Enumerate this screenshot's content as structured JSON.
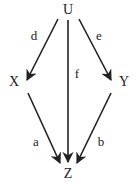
{
  "diagram": {
    "type": "directed-graph",
    "nodes": [
      {
        "id": "U",
        "label": "U",
        "x": 68,
        "y": 10
      },
      {
        "id": "X",
        "label": "X",
        "x": 14,
        "y": 82
      },
      {
        "id": "Y",
        "label": "Y",
        "x": 124,
        "y": 82
      },
      {
        "id": "Z",
        "label": "Z",
        "x": 68,
        "y": 174
      }
    ],
    "edges": [
      {
        "from": "U",
        "to": "X",
        "label": "d",
        "lx": 34,
        "ly": 35
      },
      {
        "from": "U",
        "to": "Y",
        "label": "e",
        "lx": 99,
        "ly": 35
      },
      {
        "from": "U",
        "to": "Z",
        "label": "f",
        "lx": 77,
        "ly": 73
      },
      {
        "from": "X",
        "to": "Z",
        "label": "a",
        "lx": 36,
        "ly": 141
      },
      {
        "from": "Y",
        "to": "Z",
        "label": "b",
        "lx": 101,
        "ly": 141
      }
    ],
    "colors": {
      "stroke": "#222222",
      "background": "#ffffff"
    }
  }
}
